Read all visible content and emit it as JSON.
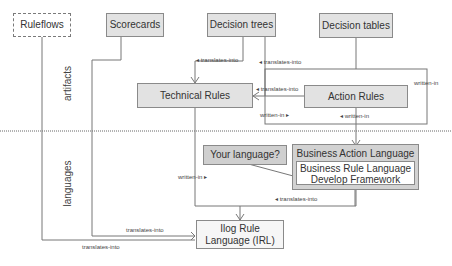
{
  "diagram": {
    "sections": {
      "artifacts": "artifacts",
      "languages": "languages"
    },
    "nodes": {
      "ruleflows": "Ruleflows",
      "scorecards": "Scorecards",
      "decision_trees": "Decision trees",
      "decision_tables": "Decision tables",
      "technical_rules": "Technical Rules",
      "action_rules": "Action Rules",
      "your_language": "Your language?",
      "business_action_language": "Business Action Language",
      "brldf_line1": "Business Rule Language",
      "brldf_line2": "Develop Framework",
      "irl_line1": "Ilog Rule",
      "irl_line2": "Language (IRL)"
    },
    "edge_labels": {
      "dtrees_to_tech": "◂ translates-into",
      "dtables_to_tech": "◂ translates-into",
      "action_to_tech": "◂ translates-into",
      "written_in_right": "written-in",
      "written_in_left": "written-in ▸",
      "written_in_action": "◂ written-in",
      "written_in_tech": "written-in ▸",
      "bal_to_irl": "◂ translates-into",
      "scorecards_to_irl": "translates-into",
      "ruleflows_to_irl": "translates-into"
    },
    "colors": {
      "line": "#777777",
      "box_fill": "#e2e2e2",
      "box_border": "#8a8a8a"
    }
  }
}
